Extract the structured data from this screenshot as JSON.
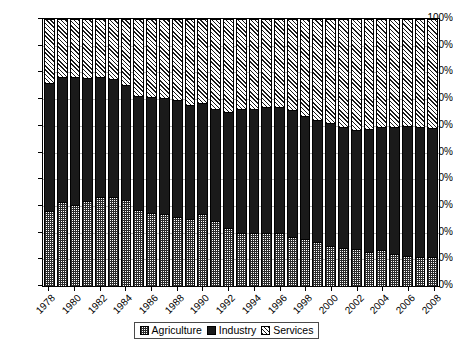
{
  "chart_data": {
    "type": "bar",
    "stacked": true,
    "title": "",
    "xlabel": "",
    "ylabel": "",
    "ylim": [
      0,
      100
    ],
    "y_tick_labels": [
      "0%",
      "10%",
      "20%",
      "30%",
      "40%",
      "50%",
      "60%",
      "70%",
      "80%",
      "90%",
      "100%"
    ],
    "y_ticks": [
      0,
      10,
      20,
      30,
      40,
      50,
      60,
      70,
      80,
      90,
      100
    ],
    "grid": true,
    "legend_position": "bottom",
    "categories": [
      "1978",
      "1979",
      "1980",
      "1981",
      "1982",
      "1983",
      "1984",
      "1985",
      "1986",
      "1987",
      "1988",
      "1989",
      "1990",
      "1991",
      "1992",
      "1993",
      "1994",
      "1995",
      "1996",
      "1997",
      "1998",
      "1999",
      "2000",
      "2001",
      "2002",
      "2003",
      "2004",
      "2005",
      "2006",
      "2007",
      "2008"
    ],
    "x_tick_labels": [
      "1978",
      "1980",
      "1982",
      "1984",
      "1986",
      "1988",
      "1990",
      "1992",
      "1994",
      "1996",
      "1998",
      "2000",
      "2002",
      "2004",
      "2006",
      "2008"
    ],
    "series": [
      {
        "name": "Agriculture",
        "pattern": "dotted",
        "values": [
          28.2,
          31.3,
          30.2,
          31.9,
          33.4,
          33.2,
          32.1,
          28.4,
          27.2,
          26.8,
          25.7,
          25.1,
          27.1,
          24.5,
          21.8,
          19.7,
          19.8,
          19.9,
          19.7,
          18.3,
          17.6,
          16.5,
          15.1,
          14.4,
          13.7,
          12.8,
          13.4,
          12.1,
          11.1,
          10.8,
          10.7
        ]
      },
      {
        "name": "Industry",
        "pattern": "solid-black",
        "values": [
          47.9,
          47.1,
          48.2,
          46.1,
          44.8,
          44.4,
          43.1,
          42.9,
          43.7,
          43.6,
          43.8,
          42.8,
          41.3,
          41.8,
          43.4,
          46.6,
          46.6,
          47.2,
          47.5,
          47.5,
          46.2,
          45.8,
          45.9,
          45.1,
          44.8,
          46.0,
          46.2,
          47.4,
          48.7,
          48.6,
          48.6
        ]
      },
      {
        "name": "Services",
        "pattern": "diagonal-hatch",
        "values": [
          23.9,
          21.6,
          21.6,
          22.0,
          21.8,
          22.4,
          24.8,
          28.7,
          29.1,
          29.6,
          30.5,
          32.1,
          31.6,
          33.7,
          34.8,
          33.7,
          33.6,
          32.9,
          32.8,
          34.2,
          36.2,
          37.7,
          39.0,
          40.5,
          41.5,
          41.2,
          40.4,
          40.5,
          40.2,
          40.6,
          40.7
        ]
      }
    ]
  },
  "legend": {
    "items": [
      {
        "label": "Agriculture"
      },
      {
        "label": "Industry"
      },
      {
        "label": "Services"
      }
    ]
  }
}
